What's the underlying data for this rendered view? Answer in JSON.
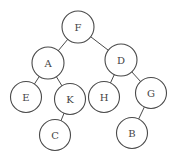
{
  "diagram": {
    "type": "binary-tree",
    "root": "F",
    "nodes": [
      {
        "id": "F",
        "label": "F",
        "x": 78,
        "y": 27,
        "r": 16
      },
      {
        "id": "A",
        "label": "A",
        "x": 48,
        "y": 63,
        "r": 16
      },
      {
        "id": "D",
        "label": "D",
        "x": 121,
        "y": 60,
        "r": 16
      },
      {
        "id": "E",
        "label": "E",
        "x": 26,
        "y": 97,
        "r": 15.5
      },
      {
        "id": "K",
        "label": "K",
        "x": 70,
        "y": 99,
        "r": 15.5
      },
      {
        "id": "H",
        "label": "H",
        "x": 104,
        "y": 97,
        "r": 15.5
      },
      {
        "id": "G",
        "label": "G",
        "x": 151,
        "y": 93,
        "r": 15.5
      },
      {
        "id": "C",
        "label": "C",
        "x": 55,
        "y": 135,
        "r": 15.5
      },
      {
        "id": "B",
        "label": "B",
        "x": 132,
        "y": 133,
        "r": 15.5
      }
    ],
    "edges": [
      {
        "from": "F",
        "to": "A"
      },
      {
        "from": "F",
        "to": "D"
      },
      {
        "from": "A",
        "to": "E"
      },
      {
        "from": "A",
        "to": "K"
      },
      {
        "from": "K",
        "to": "C"
      },
      {
        "from": "D",
        "to": "H"
      },
      {
        "from": "D",
        "to": "G"
      },
      {
        "from": "G",
        "to": "B"
      }
    ]
  }
}
